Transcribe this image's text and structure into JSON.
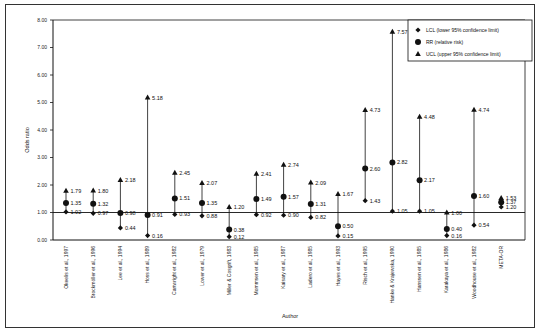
{
  "chart_data": {
    "type": "scatter",
    "subtype": "forest-plot / confidence interval plot",
    "title": "",
    "xlabel": "Author",
    "ylabel": "Odds ratio",
    "ylim": [
      0,
      8
    ],
    "yticks": [
      "0.00",
      "1.00",
      "2.00",
      "3.00",
      "4.00",
      "5.00",
      "6.00",
      "7.00",
      "8.00"
    ],
    "reference_line": 1.0,
    "grid": false,
    "legend_position": "top-right",
    "legend": [
      {
        "symbol": "diamond",
        "label": "LCL (lower 95% confidence limit)"
      },
      {
        "symbol": "circle",
        "label": "RR   (relative risk)"
      },
      {
        "symbol": "triangle",
        "label": "UCL (upper 95% confidence limit)"
      }
    ],
    "categories": [
      "Okeelis et al., 1997",
      "Brockmöller et al., 1996",
      "Lee et al., 1994",
      "Hoss et al., 1989",
      "Cartwright et al., 1982",
      "Lower et al., 1979",
      "Miller & Cosgrift, 1983",
      "Mommsen et al., 1985",
      "Kaisary et al., 1987",
      "Ladero et al., 1985",
      "Hayes et al., 1993",
      "Risch et al., 1995",
      "Hanke & Krajewska, 1990",
      "Hanssen et al., 1985",
      "Karakaya et al., 1986",
      "Woodhouse et al., 1982",
      "META-OR"
    ],
    "series": [
      {
        "name": "LCL",
        "values": [
          1.02,
          0.97,
          0.44,
          0.16,
          0.93,
          0.88,
          0.12,
          0.92,
          0.9,
          0.82,
          0.15,
          1.43,
          1.05,
          1.05,
          0.16,
          0.54,
          1.2
        ]
      },
      {
        "name": "RR",
        "values": [
          1.35,
          1.32,
          0.98,
          0.91,
          1.51,
          1.35,
          0.38,
          1.49,
          1.57,
          1.31,
          0.5,
          2.6,
          2.82,
          2.17,
          0.4,
          1.6,
          1.37
        ]
      },
      {
        "name": "UCL",
        "values": [
          1.79,
          1.8,
          2.18,
          5.18,
          2.45,
          2.07,
          1.2,
          2.41,
          2.74,
          2.09,
          1.67,
          4.73,
          7.57,
          4.48,
          1.0,
          4.74,
          1.53
        ]
      }
    ],
    "labels": {
      "LCL": [
        "1.02",
        "0.97",
        "0.44",
        "0.16",
        "0.93",
        "0.88",
        "0.12",
        "0.92",
        "0.90",
        "0.82",
        "0.15",
        "1.43",
        "1.05",
        "1.05",
        "0.16",
        "0.54",
        "1.20"
      ],
      "RR": [
        "1.35",
        "1.32",
        "0.98",
        "0.91",
        "1.51",
        "1.35",
        "0.38",
        "1.49",
        "1.57",
        "1.31",
        "0.50",
        "2.60",
        "2.82",
        "2.17",
        "0.40",
        "1.60",
        "1.37"
      ],
      "UCL": [
        "1.79",
        "1.80",
        "2.18",
        "5.18",
        "2.45",
        "2.07",
        "1.20",
        "2.41",
        "2.74",
        "2.09",
        "1.67",
        "4.73",
        "7.57",
        "4.48",
        "1.00",
        "4.74",
        "1.53"
      ]
    }
  },
  "colors": {
    "ink": "#111111",
    "frame": "#333333",
    "background": "#ffffff"
  }
}
